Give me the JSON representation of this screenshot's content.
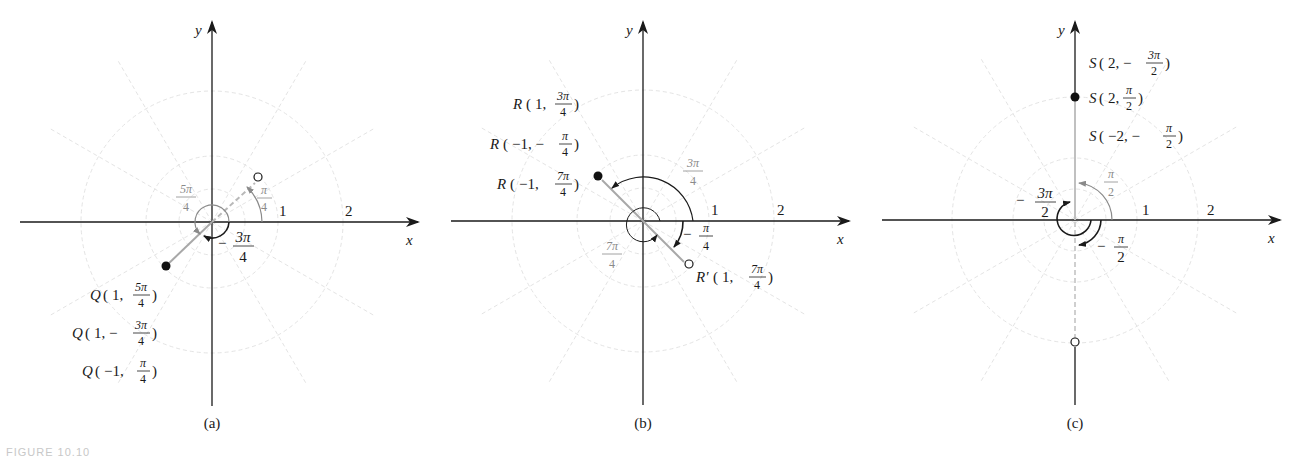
{
  "figure": {
    "caption_fragment": "FIGURE 10.10",
    "axis_labels": {
      "x": "x",
      "y": "y"
    },
    "tick_labels": [
      "1",
      "2"
    ]
  },
  "panels": [
    {
      "id": "a",
      "label": "(a)",
      "point_name": "Q",
      "representations": [
        "Q(1, 5π/4)",
        "Q(1, −3π/4)",
        "Q(−1, π/4)"
      ],
      "filled_point": {
        "r": 1,
        "theta": "5π/4"
      },
      "open_point": {
        "r": 1,
        "theta": "π/4"
      },
      "angle_labels": [
        {
          "num": "π",
          "den": "4",
          "sign": "",
          "color": "grey"
        },
        {
          "num": "5π",
          "den": "4",
          "sign": "",
          "color": "grey"
        },
        {
          "num": "3π",
          "den": "4",
          "sign": "−",
          "color": "black"
        }
      ]
    },
    {
      "id": "b",
      "label": "(b)",
      "point_name": "R",
      "representations": [
        "R(1, 3π/4)",
        "R(−1, −π/4)",
        "R(−1, 7π/4)"
      ],
      "open_point_label": "R′(1, 7π/4)",
      "filled_point": {
        "r": 1,
        "theta": "3π/4"
      },
      "open_point": {
        "r": 1,
        "theta": "7π/4"
      },
      "angle_labels": [
        {
          "num": "3π",
          "den": "4",
          "sign": "",
          "color": "grey"
        },
        {
          "num": "π",
          "den": "4",
          "sign": "−",
          "color": "black"
        },
        {
          "num": "7π",
          "den": "4",
          "sign": "",
          "color": "grey"
        }
      ]
    },
    {
      "id": "c",
      "label": "(c)",
      "point_name": "S",
      "representations": [
        "S(2, −3π/2)",
        "S(2, π/2)",
        "S(−2, −π/2)"
      ],
      "filled_point": {
        "r": 2,
        "theta": "π/2"
      },
      "open_point": {
        "r": 2,
        "theta": "−π/2"
      },
      "angle_labels": [
        {
          "num": "π",
          "den": "2",
          "sign": "",
          "color": "grey"
        },
        {
          "num": "3π",
          "den": "2",
          "sign": "−",
          "color": "black"
        },
        {
          "num": "π",
          "den": "2",
          "sign": "−",
          "color": "black"
        }
      ]
    }
  ],
  "text": {
    "a_rep0_name": "Q",
    "a_rep0_pre": "1,",
    "a_rep0_num": "5π",
    "a_rep0_den": "4",
    "a_rep1_name": "Q",
    "a_rep1_pre": "1, −",
    "a_rep1_num": "3π",
    "a_rep1_den": "4",
    "a_rep2_name": "Q",
    "a_rep2_pre": "−1,",
    "a_rep2_num": "π",
    "a_rep2_den": "4",
    "a_ang_pi4_num": "π",
    "a_ang_pi4_den": "4",
    "a_ang_5pi4_num": "5π",
    "a_ang_5pi4_den": "4",
    "a_ang_m3pi4_sign": "−",
    "a_ang_m3pi4_num": "3π",
    "a_ang_m3pi4_den": "4",
    "b_rep0_name": "R",
    "b_rep0_pre": "1,",
    "b_rep0_num": "3π",
    "b_rep0_den": "4",
    "b_rep1_name": "R",
    "b_rep1_pre": "−1, −",
    "b_rep1_num": "π",
    "b_rep1_den": "4",
    "b_rep2_name": "R",
    "b_rep2_pre": "−1,",
    "b_rep2_num": "7π",
    "b_rep2_den": "4",
    "b_open_name": "R′",
    "b_open_pre": "1,",
    "b_open_num": "7π",
    "b_open_den": "4",
    "b_ang_3pi4_num": "3π",
    "b_ang_3pi4_den": "4",
    "b_ang_mpi4_sign": "−",
    "b_ang_mpi4_num": "π",
    "b_ang_mpi4_den": "4",
    "b_ang_7pi4_num": "7π",
    "b_ang_7pi4_den": "4",
    "c_rep0_name": "S",
    "c_rep0_pre": "2, −",
    "c_rep0_num": "3π",
    "c_rep0_den": "2",
    "c_rep1_name": "S",
    "c_rep1_pre": "2,",
    "c_rep1_num": "π",
    "c_rep1_den": "2",
    "c_rep2_name": "S",
    "c_rep2_pre": "−2, −",
    "c_rep2_num": "π",
    "c_rep2_den": "2",
    "c_ang_pi2_num": "π",
    "c_ang_pi2_den": "2",
    "c_ang_m3pi2_sign": "−",
    "c_ang_m3pi2_num": "3π",
    "c_ang_m3pi2_den": "2",
    "c_ang_mpi2_sign": "−",
    "c_ang_mpi2_num": "π",
    "c_ang_mpi2_den": "2"
  },
  "colors": {
    "axis": "#1a1a1a",
    "grid": "#e2e2e2",
    "secondary": "#8a8a8a",
    "background": "#ffffff"
  }
}
